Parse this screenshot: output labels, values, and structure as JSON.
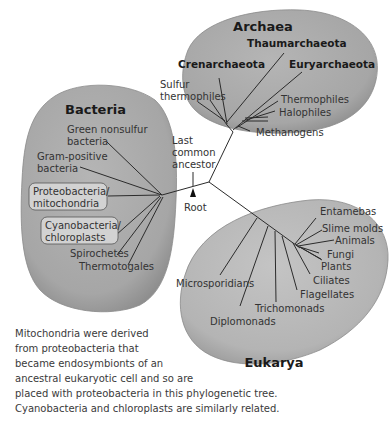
{
  "diagram": {
    "type": "phylogenetic-tree",
    "domains": {
      "archaea": {
        "title": "Archaea",
        "groups": [
          "Thaumarchaeota",
          "Crenarchaeota",
          "Euryarchaeota"
        ],
        "leaves": [
          "Sulfur",
          "thermophiles",
          "Thermophiles",
          "Halophiles",
          "Methanogens"
        ]
      },
      "bacteria": {
        "title": "Bacteria",
        "leaves": [
          "Green nonsulfur",
          "bacteria",
          "Gram-positive",
          "bacteria",
          "Spirochetes",
          "Thermotogales"
        ],
        "boxed": [
          {
            "line1": "Proteobacteria/",
            "line2": "mitochondria"
          },
          {
            "line1": "Cyanobacteria/",
            "line2": "chloroplasts"
          }
        ]
      },
      "eukarya": {
        "title": "Eukarya",
        "leaves": [
          "Entamebas",
          "Slime molds",
          "Animals",
          "Fungi",
          "Plants",
          "Ciliates",
          "Flagellates",
          "Trichomonads",
          "Microsporidians",
          "Diplomonads"
        ]
      }
    },
    "center": {
      "lca": [
        "Last",
        "common",
        "ancestor"
      ],
      "root": "Root"
    },
    "colors": {
      "blob_fill": "#a9a9a9",
      "box_fill": "#d2d2d2",
      "line": "#2b2b2b"
    }
  },
  "caption": {
    "lines": [
      "Mitochondria were derived",
      "from proteobacteria that",
      "became endosymbionts of an",
      "ancestral eukaryotic cell and so are",
      "placed with proteobacteria in this phylogenetic tree.",
      "Cyanobacteria and chloroplasts are similarly related."
    ]
  }
}
